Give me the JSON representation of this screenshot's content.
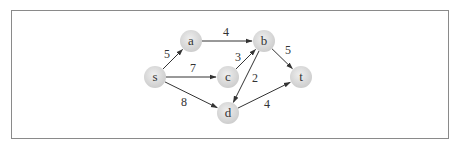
{
  "diagram": {
    "type": "directed-weighted-graph",
    "colors": {
      "node_fill_center": "#ececec",
      "node_fill_edge": "#cfcfcf",
      "edge_stroke": "#333333",
      "frame_border": "#8a8a8a",
      "text": "#333333"
    },
    "nodes": [
      {
        "id": "s",
        "label": "s",
        "x": 155,
        "y": 77
      },
      {
        "id": "a",
        "label": "a",
        "x": 191,
        "y": 41
      },
      {
        "id": "b",
        "label": "b",
        "x": 264,
        "y": 41
      },
      {
        "id": "c",
        "label": "c",
        "x": 228,
        "y": 77
      },
      {
        "id": "d",
        "label": "d",
        "x": 228,
        "y": 113
      },
      {
        "id": "t",
        "label": "t",
        "x": 301,
        "y": 77
      }
    ],
    "edges": [
      {
        "from": "s",
        "to": "a",
        "weight": "5",
        "lx": 167,
        "ly": 58
      },
      {
        "from": "s",
        "to": "c",
        "weight": "7",
        "lx": 193,
        "ly": 72
      },
      {
        "from": "s",
        "to": "d",
        "weight": "8",
        "lx": 184,
        "ly": 106
      },
      {
        "from": "a",
        "to": "b",
        "weight": "4",
        "lx": 226,
        "ly": 36
      },
      {
        "from": "c",
        "to": "b",
        "weight": "3",
        "lx": 238,
        "ly": 61
      },
      {
        "from": "b",
        "to": "d",
        "weight": "2",
        "lx": 255,
        "ly": 82
      },
      {
        "from": "b",
        "to": "t",
        "weight": "5",
        "lx": 288,
        "ly": 54
      },
      {
        "from": "d",
        "to": "t",
        "weight": "4",
        "lx": 267,
        "ly": 108
      }
    ]
  }
}
